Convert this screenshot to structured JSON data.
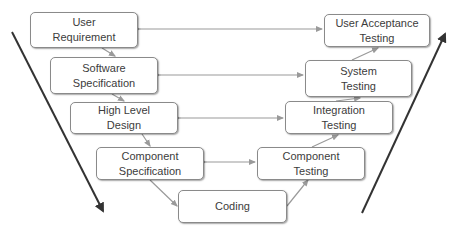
{
  "diagram": {
    "colors": {
      "box_border": "#8a8a8a",
      "connector": "#9a9a9a",
      "big_arrow": "#333333",
      "text": "#3c3c3c"
    },
    "left_branch": [
      {
        "id": "user-requirement",
        "label": "User\nRequirement",
        "x": 30,
        "y": 12,
        "w": 108,
        "h": 36
      },
      {
        "id": "software-specification",
        "label": "Software\nSpecification",
        "x": 50,
        "y": 57,
        "w": 108,
        "h": 37
      },
      {
        "id": "high-level-design",
        "label": "High Level\nDesign",
        "x": 70,
        "y": 102,
        "w": 108,
        "h": 32
      },
      {
        "id": "component-specification",
        "label": "Component\nSpecification",
        "x": 96,
        "y": 147,
        "w": 108,
        "h": 33
      }
    ],
    "bottom": {
      "id": "coding",
      "label": "Coding",
      "x": 178,
      "y": 190,
      "w": 109,
      "h": 33
    },
    "right_branch": [
      {
        "id": "user-acceptance-testing",
        "label": "User Acceptance\nTesting",
        "x": 324,
        "y": 14,
        "w": 106,
        "h": 33
      },
      {
        "id": "system-testing",
        "label": "System\nTesting",
        "x": 305,
        "y": 60,
        "w": 107,
        "h": 37
      },
      {
        "id": "integration-testing",
        "label": "Integration\nTesting",
        "x": 285,
        "y": 101,
        "w": 108,
        "h": 33
      },
      {
        "id": "component-testing",
        "label": "Component\nTesting",
        "x": 257,
        "y": 147,
        "w": 108,
        "h": 33
      }
    ],
    "big_arrows": [
      {
        "id": "left-down-arrow",
        "direction": "down",
        "x1": 12,
        "y1": 32,
        "x2": 104,
        "y2": 213
      },
      {
        "id": "right-up-arrow",
        "direction": "up",
        "x1": 362,
        "y1": 213,
        "x2": 446,
        "y2": 32
      }
    ]
  }
}
